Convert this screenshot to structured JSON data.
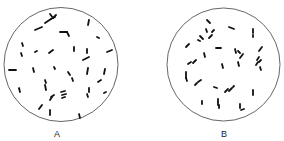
{
  "figure": {
    "stroke_color": "#111111",
    "circle_color": "#555555",
    "panels": [
      {
        "id": "A",
        "label": "A",
        "label_pos": [
          57,
          130
        ],
        "circle": {
          "cx": 61,
          "cy": 64.5,
          "r": 57
        },
        "rods": [
          [
            45,
            23,
            51,
            19
          ],
          [
            51,
            19,
            55,
            17
          ],
          [
            50,
            14,
            53,
            18
          ],
          [
            53,
            18,
            56,
            15
          ],
          [
            35,
            30,
            42,
            27
          ],
          [
            60,
            32,
            67,
            32
          ],
          [
            67,
            32,
            69,
            36
          ],
          [
            89,
            20,
            88,
            25
          ],
          [
            97,
            37,
            99,
            38
          ],
          [
            22,
            43,
            23,
            46
          ],
          [
            21,
            53,
            22,
            56
          ],
          [
            35,
            52,
            37,
            51
          ],
          [
            49,
            53,
            53,
            50
          ],
          [
            74,
            47,
            74,
            51
          ],
          [
            87,
            49,
            87,
            53
          ],
          [
            83,
            60,
            89,
            57
          ],
          [
            107,
            52,
            112,
            50
          ],
          [
            9,
            70,
            16,
            70
          ],
          [
            33,
            68,
            34,
            72
          ],
          [
            54,
            67,
            55,
            69
          ],
          [
            68,
            72,
            70,
            75
          ],
          [
            72,
            78,
            73,
            81
          ],
          [
            88,
            68,
            87,
            74
          ],
          [
            105,
            69,
            104,
            74
          ],
          [
            98,
            82,
            101,
            80
          ],
          [
            19,
            88,
            20,
            92
          ],
          [
            45,
            80,
            46,
            83
          ],
          [
            45,
            85,
            46,
            90
          ],
          [
            61,
            92,
            65,
            91
          ],
          [
            62,
            95,
            66,
            94
          ],
          [
            62,
            98,
            65,
            97
          ],
          [
            51,
            97,
            54,
            95
          ],
          [
            50,
            100,
            52,
            97
          ],
          [
            89,
            88,
            89,
            92
          ],
          [
            87,
            94,
            88,
            97
          ],
          [
            104,
            93,
            106,
            92
          ],
          [
            39,
            109,
            42,
            105
          ],
          [
            50,
            110,
            50,
            115
          ],
          [
            79,
            114,
            80,
            118
          ]
        ]
      },
      {
        "id": "B",
        "label": "B",
        "label_pos": [
          224,
          130
        ],
        "circle": {
          "cx": 223.5,
          "cy": 64.5,
          "r": 56.5
        },
        "rods": [
          [
            207,
            20,
            210,
            23
          ],
          [
            206,
            29,
            207,
            32
          ],
          [
            209,
            38,
            212,
            35
          ],
          [
            212,
            32,
            214,
            30
          ],
          [
            200,
            36,
            203,
            39
          ],
          [
            198,
            40,
            200,
            41
          ],
          [
            186,
            47,
            189,
            44
          ],
          [
            229,
            27,
            234,
            29
          ],
          [
            253,
            29,
            253,
            33
          ],
          [
            253,
            35,
            253,
            37
          ],
          [
            216,
            48,
            221,
            48
          ],
          [
            204,
            53,
            205,
            57
          ],
          [
            193,
            63,
            196,
            60
          ],
          [
            188,
            64,
            191,
            62
          ],
          [
            222,
            64,
            223,
            68
          ],
          [
            235,
            49,
            236,
            53
          ],
          [
            238,
            51,
            240,
            53
          ],
          [
            240,
            58,
            243,
            54
          ],
          [
            238,
            62,
            239,
            66
          ],
          [
            259,
            51,
            262,
            47
          ],
          [
            257,
            60,
            259,
            57
          ],
          [
            256,
            65,
            258,
            62
          ],
          [
            259,
            62,
            261,
            60
          ],
          [
            260,
            67,
            261,
            70
          ],
          [
            186,
            72,
            186,
            78
          ],
          [
            186,
            78,
            187,
            81
          ],
          [
            198,
            82,
            201,
            80
          ],
          [
            195,
            85,
            197,
            83
          ],
          [
            214,
            87,
            217,
            88
          ],
          [
            225,
            92,
            228,
            89
          ],
          [
            229,
            91,
            232,
            88
          ],
          [
            233,
            87,
            234,
            86
          ],
          [
            253,
            90,
            253,
            95
          ],
          [
            202,
            101,
            202,
            104
          ],
          [
            218,
            99,
            218,
            105
          ],
          [
            219,
            105,
            219,
            108
          ],
          [
            240,
            104,
            240,
            108
          ],
          [
            241,
            110,
            244,
            109
          ]
        ]
      }
    ]
  }
}
